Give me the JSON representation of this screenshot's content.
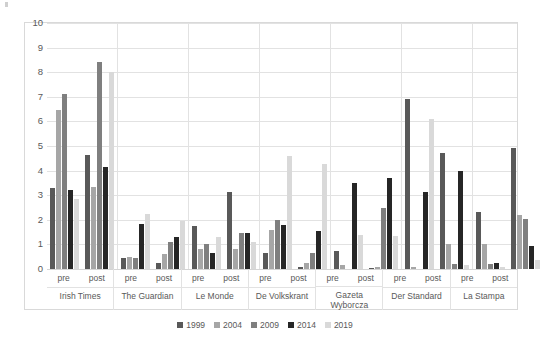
{
  "chart_data": {
    "type": "bar",
    "title": "",
    "subtitle": "",
    "xlabel": "",
    "ylabel": "",
    "ylim": [
      0,
      10
    ],
    "yticks": [
      0,
      1,
      2,
      3,
      4,
      5,
      6,
      7,
      8,
      9,
      10
    ],
    "grid": true,
    "legend_position": "bottom",
    "legend": [
      "1999",
      "2004",
      "2009",
      "2014",
      "2019"
    ],
    "series_colors": [
      "#595959",
      "#a6a6a6",
      "#7f7f7f",
      "#262626",
      "#d9d9d9"
    ],
    "group_labels": [
      "pre",
      "post"
    ],
    "categories": [
      "Irish Times",
      "The Guardian",
      "Le Monde",
      "De Volkskrant",
      "Gazeta Wyborcza",
      "Der Standard",
      "La Stampa"
    ],
    "groups": [
      {
        "category": "Irish Times",
        "periods": [
          {
            "label": "pre",
            "values": [
              3.3,
              6.45,
              7.1,
              3.2,
              2.85
            ]
          },
          {
            "label": "post",
            "values": [
              4.65,
              3.35,
              8.4,
              4.15,
              8.0
            ]
          }
        ]
      },
      {
        "category": "The Guardian",
        "periods": [
          {
            "label": "pre",
            "values": [
              0.45,
              0.5,
              0.45,
              1.85,
              2.25
            ]
          },
          {
            "label": "post",
            "values": [
              0.25,
              0.6,
              1.1,
              1.3,
              1.95
            ]
          }
        ]
      },
      {
        "category": "Le Monde",
        "periods": [
          {
            "label": "pre",
            "values": [
              1.75,
              0.8,
              1.0,
              0.65,
              1.3
            ]
          },
          {
            "label": "post",
            "values": [
              3.15,
              0.8,
              1.45,
              1.45,
              1.1
            ]
          }
        ]
      },
      {
        "category": "De Volkskrant",
        "periods": [
          {
            "label": "pre",
            "values": [
              0.65,
              1.6,
              2.0,
              1.8,
              4.6
            ]
          },
          {
            "label": "post",
            "values": [
              0.1,
              0.25,
              0.65,
              1.55,
              4.25
            ]
          }
        ]
      },
      {
        "category": "Gazeta Wyborcza",
        "periods": [
          {
            "label": "pre",
            "values": [
              0.75,
              0.15,
              0.0,
              3.5,
              1.4
            ]
          },
          {
            "label": "post",
            "values": [
              0.05,
              0.1,
              2.5,
              3.7,
              1.35
            ]
          }
        ]
      },
      {
        "category": "Der Standard",
        "periods": [
          {
            "label": "pre",
            "values": [
              6.9,
              0.1,
              0.0,
              3.15,
              6.1
            ]
          },
          {
            "label": "post",
            "values": [
              4.7,
              1.0,
              0.2,
              4.0,
              0.15
            ]
          }
        ]
      },
      {
        "category": "La Stampa",
        "periods": [
          {
            "label": "pre",
            "values": [
              2.3,
              1.0,
              0.2,
              0.25,
              0.1
            ]
          },
          {
            "label": "post",
            "values": [
              4.9,
              2.2,
              2.05,
              0.95,
              0.35
            ]
          }
        ]
      }
    ]
  }
}
